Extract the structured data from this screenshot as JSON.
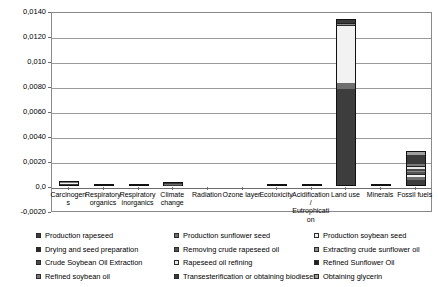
{
  "chart_data": {
    "type": "bar",
    "stacked": true,
    "title": "",
    "subtitle": "",
    "xlabel": "",
    "ylabel": "",
    "ylim": [
      -0.002,
      0.014
    ],
    "grid": true,
    "legend_position": "bottom",
    "decimal_separator": ",",
    "ytick_labels": [
      "0,0140",
      "0,0120",
      "0,010",
      "0,0080",
      "0,0060",
      "0,0040",
      "0,0020",
      "0,0",
      "-0,0020"
    ],
    "ytick_values": [
      0.014,
      0.012,
      0.01,
      0.008,
      0.006,
      0.004,
      0.002,
      0.0,
      -0.002
    ],
    "categories": [
      "Carcinogens",
      "Respiratory organics",
      "Respiratory inorganics",
      "Climate change",
      "Radiation",
      "Ozone layer",
      "Ecotoxicity",
      "Acidification/ Eutrophication",
      "Land use",
      "Minerals",
      "Fossil fuels"
    ],
    "series": [
      {
        "name": "Production rapeseed",
        "color": "#3d3d3d",
        "values": [
          0.00012,
          1e-05,
          4e-05,
          6e-05,
          0.0,
          0.0,
          2e-05,
          3e-05,
          0.0078,
          1e-05,
          0.00045
        ]
      },
      {
        "name": "Production sunflower seed",
        "color": "#6e6e6e",
        "values": [
          6e-05,
          1e-05,
          2e-05,
          4e-05,
          0.0,
          0.0,
          1e-05,
          2e-05,
          0.0005,
          0.0,
          0.00022
        ]
      },
      {
        "name": "Production soybean seed",
        "color": "#f2f2f2",
        "values": [
          4e-05,
          0.0,
          2e-05,
          3e-05,
          0.0,
          0.0,
          1e-05,
          1e-05,
          0.0046,
          0.0,
          0.00018
        ]
      },
      {
        "name": "Drying and seed preparation",
        "color": "#2a2a2a",
        "values": [
          2e-05,
          0.0,
          1e-05,
          2e-05,
          0.0,
          0.0,
          0.0,
          1e-05,
          5e-05,
          0.0,
          0.00012
        ]
      },
      {
        "name": "Removing crude rapeseed oil",
        "color": "#555555",
        "values": [
          2e-05,
          0.0,
          1e-05,
          2e-05,
          0.0,
          0.0,
          0.0,
          1e-05,
          4e-05,
          0.0,
          0.00014
        ]
      },
      {
        "name": "Extracting crude sunflower oil",
        "color": "#8c8c8c",
        "values": [
          2e-05,
          0.0,
          1e-05,
          2e-05,
          0.0,
          0.0,
          0.0,
          1e-05,
          3e-05,
          0.0,
          0.00012
        ]
      },
      {
        "name": "Crude Soybean Oil Extraction",
        "color": "#4a4a4a",
        "values": [
          2e-05,
          0.0,
          1e-05,
          2e-05,
          0.0,
          0.0,
          0.0,
          1e-05,
          3e-05,
          0.0,
          0.00013
        ]
      },
      {
        "name": "Rapeseed oil refining",
        "color": "#e8e8e8",
        "values": [
          2e-05,
          0.0,
          1e-05,
          2e-05,
          0.0,
          0.0,
          0.0,
          1e-05,
          3e-05,
          0.0,
          0.00016
        ]
      },
      {
        "name": "Refined Sunflower Oil",
        "color": "#1f1f1f",
        "values": [
          2e-05,
          0.0,
          1e-05,
          2e-05,
          0.0,
          0.0,
          0.0,
          1e-05,
          3e-05,
          0.0,
          0.00013
        ]
      },
      {
        "name": "Refined soybean oil",
        "color": "#7a7a7a",
        "values": [
          2e-05,
          0.0,
          1e-05,
          2e-05,
          0.0,
          0.0,
          0.0,
          1e-05,
          3e-05,
          0.0,
          0.00012
        ]
      },
      {
        "name": "Transesterification or obtaining biodiesel",
        "color": "#3a3a3a",
        "values": [
          2e-05,
          0.0,
          1e-05,
          2e-05,
          0.0,
          0.0,
          0.0,
          1e-05,
          0.00022,
          0.0,
          0.00075
        ]
      },
      {
        "name": "Obtaining glycerin",
        "color": "#9e9e9e",
        "values": [
          2e-05,
          0.0,
          1e-05,
          1e-05,
          0.0,
          0.0,
          0.0,
          0.0,
          4e-05,
          0.0,
          0.00028
        ]
      }
    ],
    "totals": [
      0.0004,
      3e-05,
      0.00016,
      0.00029,
      0.0,
      0.0,
      4e-05,
      0.00013,
      0.0134,
      1e-05,
      0.0028
    ]
  },
  "legend": {
    "columns": 3,
    "rows": 4,
    "items": [
      {
        "label": "Production rapeseed",
        "color": "#3d3d3d"
      },
      {
        "label": "Production sunflower seed",
        "color": "#6e6e6e"
      },
      {
        "label": "Production soybean seed",
        "color": "#f2f2f2"
      },
      {
        "label": "Drying and seed preparation",
        "color": "#2a2a2a"
      },
      {
        "label": "Removing crude rapeseed oil",
        "color": "#555555"
      },
      {
        "label": "Extracting crude sunflower oil",
        "color": "#8c8c8c"
      },
      {
        "label": "Crude Soybean Oil Extraction",
        "color": "#4a4a4a"
      },
      {
        "label": "Rapeseed oil refining",
        "color": "#e8e8e8"
      },
      {
        "label": "Refined Sunflower Oil",
        "color": "#1f1f1f"
      },
      {
        "label": "Refined soybean oil",
        "color": "#7a7a7a"
      },
      {
        "label": "Transesterification or obtaining biodiesel",
        "color": "#3a3a3a"
      },
      {
        "label": "Obtaining glycerin",
        "color": "#9e9e9e"
      }
    ]
  }
}
